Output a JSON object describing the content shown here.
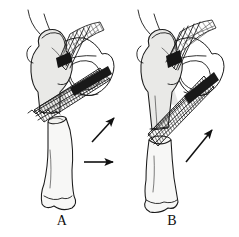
{
  "figure": {
    "background_color": "#ffffff",
    "ink_color": "#1a1a1a",
    "bone_fill_color": "#e9e9e7",
    "shaft_fill_color": "#f7f7f6",
    "width": 239,
    "height": 237
  },
  "panels": [
    {
      "id": "A",
      "label": "A",
      "label_x": 62,
      "label_y": 225,
      "description": "Subtrochanteric femur fracture with overriding and shortening; proximal fragment abducted and flexed, distal fragment displaced laterally and proximally",
      "fracture_type": "overriding-shortened",
      "arrows": [
        {
          "name": "superior-displacement-arrow",
          "direction": "up-right",
          "x1": 92,
          "y1": 142,
          "x2": 117,
          "y2": 115
        },
        {
          "name": "lateral-displacement-arrow",
          "direction": "right",
          "x1": 84,
          "y1": 162,
          "x2": 117,
          "y2": 162
        }
      ],
      "anatomy": [
        "femoral-head",
        "femoral-neck",
        "greater-trochanter",
        "lesser-trochanter",
        "femoral-shaft",
        "distal-femoral-condyles",
        "iliac-crest-line",
        "acetabulum",
        "obturator-foramen",
        "pubic-ramus",
        "ischium"
      ],
      "muscle_bundles": [
        "iliopsoas-bundle-upper",
        "adductor-bundle-lower"
      ]
    },
    {
      "id": "B",
      "label": "B",
      "label_x": 172,
      "label_y": 225,
      "description": "Subtrochanteric femur fracture with distraction at the fracture site; single proximal displacement vector along the adductor pull",
      "fracture_type": "distracted-transverse",
      "arrows": [
        {
          "name": "superior-displacement-arrow",
          "direction": "up-right",
          "x1": 188,
          "y1": 160,
          "x2": 215,
          "y2": 127
        }
      ],
      "anatomy": [
        "femoral-head",
        "femoral-neck",
        "greater-trochanter",
        "lesser-trochanter",
        "femoral-shaft",
        "distal-femoral-condyles",
        "iliac-crest-line",
        "acetabulum",
        "obturator-foramen",
        "pubic-ramus",
        "ischium"
      ],
      "muscle_bundles": [
        "iliopsoas-bundle-upper",
        "adductor-bundle-lower"
      ]
    }
  ]
}
